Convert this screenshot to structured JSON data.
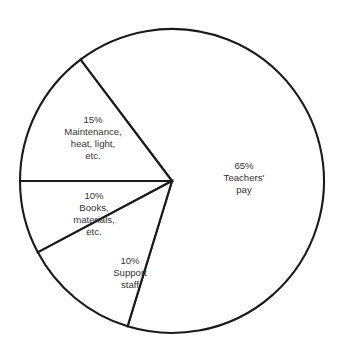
{
  "chart_data": {
    "type": "pie",
    "title": "",
    "subtitle": "",
    "xlabel": "",
    "ylabel": "",
    "legend_position": "none",
    "grid": false,
    "labels_inside": true,
    "unit": "%",
    "total": 100,
    "categories": [
      "Teachers' pay",
      "Maintenance, heat, light, etc.",
      "Books, materials, etc.",
      "Support staff"
    ],
    "values": [
      65,
      10,
      15,
      10
    ],
    "slices": [
      {
        "id": "teachers-pay",
        "percent_text": "65%",
        "percent_value": 65,
        "name_lines": [
          "Teachers'",
          "pay"
        ],
        "label_lines": [
          "65%",
          "Teachers'",
          "pay"
        ],
        "start_angle_deg": -107,
        "end_angle_deg": 127,
        "label_x": 244,
        "label_y": 178
      },
      {
        "id": "maintenance",
        "percent_text": "15%",
        "percent_value": 15,
        "name_lines": [
          "Maintenance,",
          "heat, light,",
          "etc."
        ],
        "label_lines": [
          "15%",
          "Maintenance,",
          "heat, light,",
          "etc."
        ],
        "start_angle_deg": 127,
        "end_angle_deg": 180,
        "label_x": 93,
        "label_y": 138
      },
      {
        "id": "books-materials",
        "percent_text": "10%",
        "percent_value": 10,
        "name_lines": [
          "Books,",
          "materials,",
          "etc."
        ],
        "label_lines": [
          "10%",
          "Books,",
          "materials,",
          "etc."
        ],
        "start_angle_deg": 180,
        "end_angle_deg": 208,
        "label_x": 94,
        "label_y": 214
      },
      {
        "id": "support-staff",
        "percent_text": "10%",
        "percent_value": 10,
        "name_lines": [
          "Support",
          "staff"
        ],
        "label_lines": [
          "10%",
          "Support",
          "staff"
        ],
        "start_angle_deg": 208,
        "end_angle_deg": 253,
        "label_x": 130,
        "label_y": 273
      }
    ],
    "geometry": {
      "center_x": 172,
      "center_y": 181,
      "radius": 152
    },
    "colors": {
      "slice_fill": "#ffffff",
      "slice_stroke": "#1a1a1a",
      "text": "#333333",
      "background": "#ffffff"
    }
  }
}
